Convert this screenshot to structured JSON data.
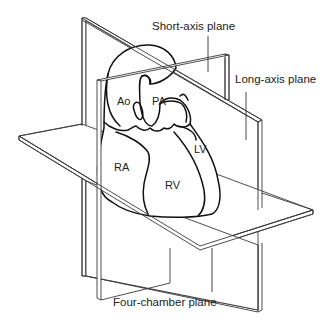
{
  "diagram": {
    "type": "anatomical-planes",
    "labels": {
      "short_axis": "Short-axis plane",
      "long_axis": "Long-axis plane",
      "four_chamber": "Four-chamber plane"
    },
    "chambers": {
      "ao": "Ao",
      "pa": "PA",
      "ra": "RA",
      "rv": "RV",
      "lv": "LV"
    },
    "colors": {
      "line": "#3a3a3a",
      "heart_outline": "#111111",
      "background": "#ffffff"
    }
  }
}
